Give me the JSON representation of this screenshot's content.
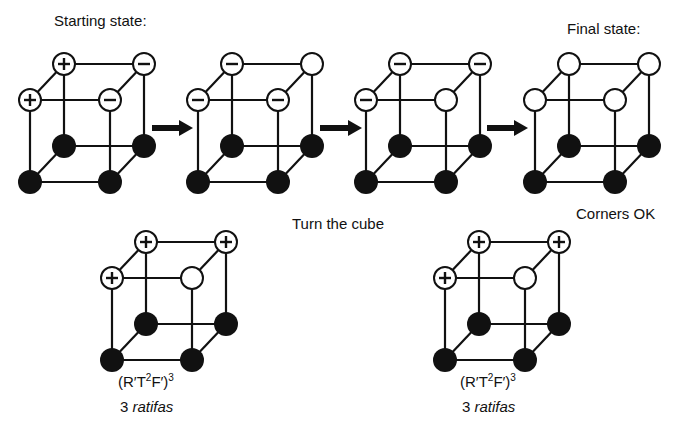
{
  "labels": {
    "starting_state": "Starting state:",
    "final_state": "Final state:",
    "turn_the_cube": "Turn the cube",
    "corners_ok": "Corners OK"
  },
  "formula_left": {
    "prefix": "(R′T",
    "exp1": "2",
    "mid": "F′)",
    "exp2": "3",
    "count": "3",
    "unit": "ratifas"
  },
  "formula_right": {
    "prefix": "(R′T",
    "exp1": "2",
    "mid": "F′)",
    "exp2": "3",
    "count": "3",
    "unit": "ratifas"
  },
  "cubes": [
    {
      "name": "starting",
      "btl": "+",
      "btr": "-",
      "ftl": "+",
      "ftr": "-"
    },
    {
      "name": "step-2",
      "btl": "-",
      "btr": "",
      "ftl": "-",
      "ftr": "-"
    },
    {
      "name": "step-3",
      "btl": "-",
      "btr": "-",
      "ftl": "-",
      "ftr": ""
    },
    {
      "name": "final",
      "btl": "",
      "btr": "",
      "ftl": "",
      "ftr": ""
    },
    {
      "name": "bottom-left",
      "btl": "+",
      "btr": "+",
      "ftl": "+",
      "ftr": ""
    },
    {
      "name": "bottom-right",
      "btl": "+",
      "btr": "+",
      "ftl": "+",
      "ftr": ""
    }
  ],
  "colors": {
    "ink": "#111111",
    "background": "#ffffff"
  }
}
